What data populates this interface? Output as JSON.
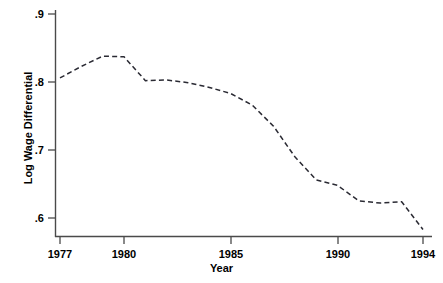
{
  "figure": {
    "background_color": "#ffffff",
    "line_color": "#2a2a33",
    "axis_color": "#4a4a4a"
  },
  "chart_data": {
    "type": "line",
    "title": "",
    "xlabel": "Year",
    "ylabel": "Log Wage Differential",
    "xlim": [
      1976.6,
      1994.3
    ],
    "ylim": [
      0.575,
      0.905
    ],
    "grid": false,
    "legend": null,
    "line_style": "dashed",
    "xticks": [
      1977,
      1980,
      1985,
      1990,
      1994
    ],
    "xtick_labels": [
      "1977",
      "1980",
      "1985",
      "1990",
      "1994"
    ],
    "yticks": [
      0.6,
      0.7,
      0.8,
      0.9
    ],
    "ytick_labels": [
      ".6",
      ".7",
      ".8",
      ".9"
    ],
    "x": [
      1977,
      1978,
      1979,
      1980,
      1981,
      1982,
      1983,
      1984,
      1985,
      1986,
      1987,
      1988,
      1989,
      1990,
      1991,
      1992,
      1993,
      1994
    ],
    "values": [
      0.806,
      0.823,
      0.838,
      0.837,
      0.802,
      0.803,
      0.799,
      0.792,
      0.783,
      0.766,
      0.735,
      0.69,
      0.656,
      0.648,
      0.625,
      0.622,
      0.624,
      0.583
    ],
    "series": [
      {
        "name": "Log Wage Differential",
        "values": [
          0.806,
          0.823,
          0.838,
          0.837,
          0.802,
          0.803,
          0.799,
          0.792,
          0.783,
          0.766,
          0.735,
          0.69,
          0.656,
          0.648,
          0.625,
          0.622,
          0.624,
          0.583
        ]
      }
    ]
  }
}
